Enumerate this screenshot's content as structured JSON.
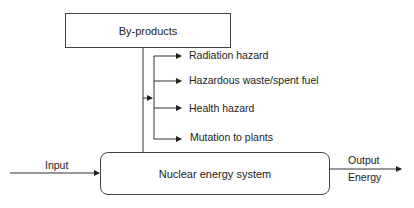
{
  "diagram": {
    "byproducts_box": {
      "label": "By-products"
    },
    "system_box": {
      "label": "Nuclear energy system"
    },
    "input_label": "Input",
    "output_labels": {
      "top": "Output",
      "bottom": "Energy"
    },
    "byproduct_items": [
      {
        "label": "Radiation hazard"
      },
      {
        "label": "Hazardous waste/spent fuel"
      },
      {
        "label": "Health hazard"
      },
      {
        "label": "Mutation to plants"
      }
    ],
    "colors": {
      "line": "#333333",
      "border": "#444444",
      "text": "#222222"
    }
  }
}
